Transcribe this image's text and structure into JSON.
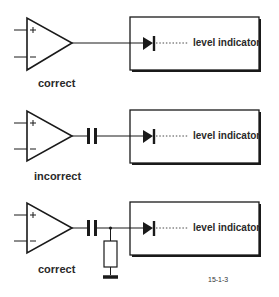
{
  "diagram": {
    "rows": [
      {
        "verdict": "correct",
        "coupling": "direct",
        "indicator_label": "level indicator",
        "components": [
          "op-amp",
          "wire",
          "diode",
          "level indicator"
        ]
      },
      {
        "verdict": "incorrect",
        "coupling": "capacitor",
        "indicator_label": "level indicator",
        "components": [
          "op-amp",
          "capacitor",
          "diode",
          "level indicator"
        ]
      },
      {
        "verdict": "correct",
        "coupling": "capacitor with resistor to ground",
        "indicator_label": "level indicator",
        "components": [
          "op-amp",
          "capacitor",
          "resistor",
          "ground",
          "diode",
          "level indicator"
        ]
      }
    ],
    "opamp_inputs": {
      "plus": "+",
      "minus": "−"
    },
    "figure_id": "15-1-3",
    "colors": {
      "line": "#1a1a1a",
      "background": "#ffffff",
      "text": "#2a2a2a"
    }
  }
}
